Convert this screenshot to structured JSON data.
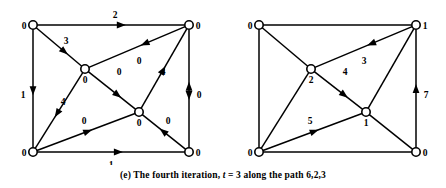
{
  "figure": {
    "caption_prefix": "(e)",
    "caption_text_1": "The fourth iteration,",
    "caption_var": "t",
    "caption_text_2": "= 3 along the path 6,2,3",
    "stroke_color": "#000000",
    "background_color": "#ffffff"
  },
  "graphs": [
    {
      "id": "left-graph",
      "name": "flow-network-left",
      "nodes": [
        {
          "id": "n1",
          "label": "0",
          "x": 33,
          "y": 25,
          "label_dx": -9,
          "label_dy": 4
        },
        {
          "id": "n2",
          "label": "0",
          "x": 189,
          "y": 25,
          "label_dx": 9,
          "label_dy": 4
        },
        {
          "id": "n3",
          "label": "0",
          "x": 85,
          "y": 69,
          "label_dx": 0,
          "label_dy": 14
        },
        {
          "id": "n4",
          "label": "0",
          "x": 139,
          "y": 112,
          "label_dx": 0,
          "label_dy": 14
        },
        {
          "id": "n5",
          "label": "0",
          "x": 33,
          "y": 152,
          "label_dx": -9,
          "label_dy": 4
        },
        {
          "id": "n6",
          "label": "0",
          "x": 189,
          "y": 152,
          "label_dx": 9,
          "label_dy": 4
        }
      ],
      "edges": [
        {
          "from": "n1",
          "to": "n2",
          "label": "2",
          "label_x": 115,
          "label_y": 18,
          "arrow": "forward",
          "arrow_t": 0.57
        },
        {
          "from": "n1",
          "to": "n5",
          "label": "1",
          "label_x": 23,
          "label_y": 98,
          "arrow": "forward",
          "arrow_t": 0.52
        },
        {
          "from": "n1",
          "to": "n3",
          "label": "3",
          "label_x": 66,
          "label_y": 44,
          "arrow": "forward",
          "arrow_t": 0.62
        },
        {
          "from": "n2",
          "to": "n3",
          "label": "0",
          "label_x": 139,
          "label_y": 64,
          "arrow": "forward",
          "arrow_t": 0.42
        },
        {
          "from": "n2",
          "to": "n4",
          "label": "4",
          "label_x": 163,
          "label_y": 75,
          "arrow": "backward",
          "arrow_t": 0.52
        },
        {
          "from": "n3",
          "to": "n4",
          "label": "0",
          "label_x": 119,
          "label_y": 75,
          "arrow": "forward",
          "arrow_t": 0.62
        },
        {
          "from": "n5",
          "to": "n3",
          "label": "4",
          "label_x": 63,
          "label_y": 105,
          "arrow": "backward",
          "arrow_t": 0.46
        },
        {
          "from": "n5",
          "to": "n4",
          "label": "0",
          "label_x": 84,
          "label_y": 124,
          "arrow": "forward",
          "arrow_t": 0.52
        },
        {
          "from": "n6",
          "to": "n4",
          "label": "0",
          "label_x": 168,
          "label_y": 124,
          "arrow": "forward",
          "arrow_t": 0.52
        },
        {
          "from": "n5",
          "to": "n6",
          "label": "1",
          "label_x": 111,
          "label_y": 168,
          "arrow": "forward",
          "arrow_t": 0.55
        },
        {
          "from": "n2",
          "to": "n6",
          "label": "0",
          "label_x": 199,
          "label_y": 98,
          "arrow": "both",
          "arrow_t": 0.52
        }
      ]
    },
    {
      "id": "right-graph",
      "name": "flow-network-right",
      "nodes": [
        {
          "id": "m1",
          "label": "0",
          "x": 259,
          "y": 25,
          "label_dx": -9,
          "label_dy": 4
        },
        {
          "id": "m2",
          "label": "1",
          "x": 416,
          "y": 25,
          "label_dx": 9,
          "label_dy": 4
        },
        {
          "id": "m3",
          "label": "2",
          "x": 311,
          "y": 69,
          "label_dx": 0,
          "label_dy": 14
        },
        {
          "id": "m4",
          "label": "1",
          "x": 366,
          "y": 112,
          "label_dx": 0,
          "label_dy": 14
        },
        {
          "id": "m5",
          "label": "0",
          "x": 259,
          "y": 152,
          "label_dx": -9,
          "label_dy": 4
        },
        {
          "id": "m6",
          "label": "0",
          "x": 416,
          "y": 152,
          "label_dx": 9,
          "label_dy": 4
        }
      ],
      "edges": [
        {
          "from": "m1",
          "to": "m2",
          "label": "",
          "label_x": 0,
          "label_y": 0,
          "arrow": "none",
          "arrow_t": 0.5
        },
        {
          "from": "m1",
          "to": "m5",
          "label": "",
          "label_x": 0,
          "label_y": 0,
          "arrow": "none",
          "arrow_t": 0.5
        },
        {
          "from": "m1",
          "to": "m3",
          "label": "",
          "label_x": 0,
          "label_y": 0,
          "arrow": "none",
          "arrow_t": 0.5
        },
        {
          "from": "m2",
          "to": "m3",
          "label": "3",
          "label_x": 364,
          "label_y": 64,
          "arrow": "forward",
          "arrow_t": 0.42
        },
        {
          "from": "m2",
          "to": "m4",
          "label": "",
          "label_x": 0,
          "label_y": 0,
          "arrow": "none",
          "arrow_t": 0.5
        },
        {
          "from": "m3",
          "to": "m4",
          "label": "4",
          "label_x": 345,
          "label_y": 75,
          "arrow": "forward",
          "arrow_t": 0.62
        },
        {
          "from": "m5",
          "to": "m3",
          "label": "",
          "label_x": 0,
          "label_y": 0,
          "arrow": "none",
          "arrow_t": 0.5
        },
        {
          "from": "m5",
          "to": "m4",
          "label": "5",
          "label_x": 310,
          "label_y": 124,
          "arrow": "forward",
          "arrow_t": 0.52
        },
        {
          "from": "m6",
          "to": "m4",
          "label": "",
          "label_x": 0,
          "label_y": 0,
          "arrow": "none",
          "arrow_t": 0.5
        },
        {
          "from": "m5",
          "to": "m6",
          "label": "",
          "label_x": 0,
          "label_y": 0,
          "arrow": "none",
          "arrow_t": 0.5
        },
        {
          "from": "m2",
          "to": "m6",
          "label": "7",
          "label_x": 426,
          "label_y": 98,
          "arrow": "backward",
          "arrow_t": 0.5
        }
      ]
    }
  ]
}
